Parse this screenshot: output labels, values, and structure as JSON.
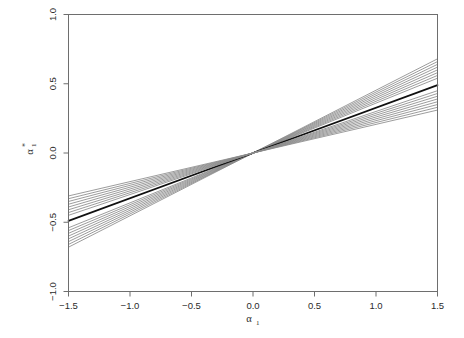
{
  "figure": {
    "background_color": "#ffffff",
    "frame_color": "#6e6e6e",
    "tick_color": "#6e6e6e",
    "text_color": "#2b2b2b",
    "emphasis_line_color": "#101010",
    "bundle_line_color": "#8a8a8a"
  },
  "axis_titles": {
    "x_base": "α",
    "x_subscript": "1",
    "x_superscript": "",
    "y_base": "α",
    "y_subscript": "1",
    "y_superscript": "*"
  },
  "chart_data": {
    "type": "line",
    "title": "",
    "subtitle": "",
    "xlabel": "α₁",
    "ylabel": "α₁*",
    "xlim": [
      -1.5,
      1.5
    ],
    "ylim": [
      -1.0,
      1.0
    ],
    "xticks": [
      -1.5,
      -1.0,
      -0.5,
      0.0,
      0.5,
      1.0,
      1.5
    ],
    "xtick_labels": [
      "-1.5",
      "-1.0",
      "-0.5",
      "0.0",
      "0.5",
      "1.0",
      "1.5"
    ],
    "yticks": [
      -1.0,
      -0.5,
      0.0,
      0.5,
      1.0
    ],
    "ytick_labels": [
      "-1.0",
      "-0.5",
      "0.0",
      "0.5",
      "1.0"
    ],
    "grid": false,
    "legend": null,
    "legend_position": "none",
    "annotations": [],
    "x": [
      -1.5,
      0.0,
      1.5
    ],
    "series": [
      {
        "name": "line-01",
        "slope": 0.453,
        "emphasis": false,
        "values": [
          -0.68,
          0.0,
          0.68
        ]
      },
      {
        "name": "line-02",
        "slope": 0.44,
        "emphasis": false,
        "values": [
          -0.66,
          0.0,
          0.66
        ]
      },
      {
        "name": "line-03",
        "slope": 0.427,
        "emphasis": false,
        "values": [
          -0.64,
          0.0,
          0.64
        ]
      },
      {
        "name": "line-04",
        "slope": 0.413,
        "emphasis": false,
        "values": [
          -0.62,
          0.0,
          0.62
        ]
      },
      {
        "name": "line-05",
        "slope": 0.4,
        "emphasis": false,
        "values": [
          -0.6,
          0.0,
          0.6
        ]
      },
      {
        "name": "line-06",
        "slope": 0.387,
        "emphasis": false,
        "values": [
          -0.58,
          0.0,
          0.58
        ]
      },
      {
        "name": "line-07",
        "slope": 0.373,
        "emphasis": false,
        "values": [
          -0.56,
          0.0,
          0.56
        ]
      },
      {
        "name": "line-08",
        "slope": 0.36,
        "emphasis": false,
        "values": [
          -0.54,
          0.0,
          0.54
        ]
      },
      {
        "name": "line-09-reference",
        "slope": 0.327,
        "emphasis": true,
        "values": [
          -0.49,
          0.0,
          0.49
        ]
      },
      {
        "name": "line-10",
        "slope": 0.3,
        "emphasis": false,
        "values": [
          -0.45,
          0.0,
          0.45
        ]
      },
      {
        "name": "line-11",
        "slope": 0.287,
        "emphasis": false,
        "values": [
          -0.43,
          0.0,
          0.43
        ]
      },
      {
        "name": "line-12",
        "slope": 0.273,
        "emphasis": false,
        "values": [
          -0.41,
          0.0,
          0.41
        ]
      },
      {
        "name": "line-13",
        "slope": 0.26,
        "emphasis": false,
        "values": [
          -0.39,
          0.0,
          0.39
        ]
      },
      {
        "name": "line-14",
        "slope": 0.247,
        "emphasis": false,
        "values": [
          -0.37,
          0.0,
          0.37
        ]
      },
      {
        "name": "line-15",
        "slope": 0.233,
        "emphasis": false,
        "values": [
          -0.35,
          0.0,
          0.35
        ]
      },
      {
        "name": "line-16",
        "slope": 0.22,
        "emphasis": false,
        "values": [
          -0.33,
          0.0,
          0.33
        ]
      },
      {
        "name": "line-17",
        "slope": 0.207,
        "emphasis": false,
        "values": [
          -0.31,
          0.0,
          0.31
        ]
      }
    ]
  }
}
